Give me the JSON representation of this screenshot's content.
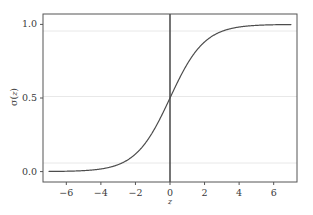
{
  "chart_data": {
    "type": "line",
    "title": "",
    "subtitle": "",
    "xlabel": "z",
    "ylabel": "σ ( z )",
    "ylabel_parts": {
      "sigma": "σ",
      "open_paren": "(",
      "variable": "z",
      "close_paren": ")"
    },
    "function": "sigmoid",
    "formula": "1 / (1 + exp(-z))",
    "xlim": [
      -7.35,
      7.35
    ],
    "ylim": [
      -0.0706,
      1.0706
    ],
    "xticks": [
      -6,
      -4,
      -2,
      0,
      2,
      4,
      6
    ],
    "xtick_labels": [
      "−6",
      "−4",
      "−2",
      "0",
      "2",
      "4",
      "6"
    ],
    "yticks": [
      0.0,
      0.5,
      1.0
    ],
    "ytick_labels": [
      "0.0",
      "0.5",
      "1.0"
    ],
    "grid": true,
    "grid_axis": "y",
    "grid_color": "#e8e8e8",
    "legend": false,
    "legend_position": "none",
    "series": [
      {
        "name": "sigma(z)",
        "color": "#4d4d4d",
        "linewidth": 1.2,
        "x": [
          -7.0,
          -6.5,
          -6.0,
          -5.5,
          -5.0,
          -4.5,
          -4.0,
          -3.5,
          -3.0,
          -2.5,
          -2.0,
          -1.5,
          -1.0,
          -0.5,
          0.0,
          0.5,
          1.0,
          1.5,
          2.0,
          2.5,
          3.0,
          3.5,
          4.0,
          4.5,
          5.0,
          5.5,
          6.0,
          6.5,
          7.0
        ],
        "values": [
          0.0009,
          0.0015,
          0.0025,
          0.0041,
          0.0067,
          0.011,
          0.018,
          0.0293,
          0.0474,
          0.0759,
          0.1192,
          0.1824,
          0.2689,
          0.3775,
          0.5,
          0.6225,
          0.7311,
          0.8176,
          0.8808,
          0.9241,
          0.9526,
          0.9707,
          0.982,
          0.989,
          0.9933,
          0.9959,
          0.9975,
          0.9985,
          0.9991
        ]
      }
    ],
    "annotations": [
      {
        "name": "zero-vertical-axis",
        "type": "vline",
        "x": 0,
        "color": "#3a3a3a",
        "linewidth": 1.4
      }
    ],
    "spines": {
      "color": "#555555",
      "linewidth": 1.0
    },
    "background_color": "#ffffff"
  },
  "figure": {
    "background_color": "#ffffff",
    "axes_rect_px": {
      "left": 43,
      "top": 14,
      "right": 297,
      "bottom": 182
    }
  }
}
